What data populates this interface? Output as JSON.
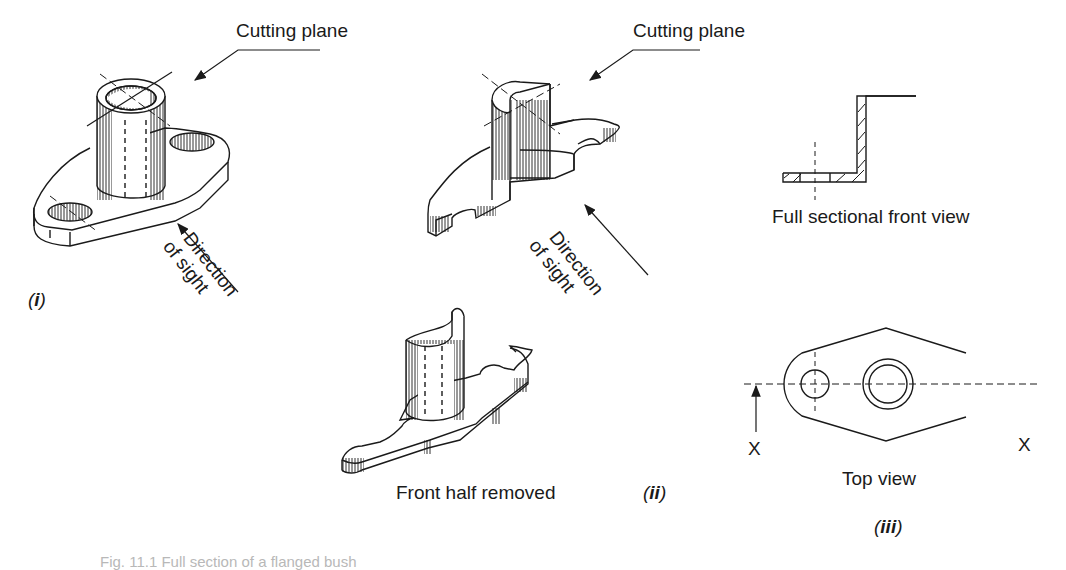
{
  "figure": {
    "panels": [
      {
        "id": "i",
        "label": "(i)",
        "description": "Isometric view of a flanged bush with cutting plane",
        "annotations": {
          "cutting_plane": "Cutting plane",
          "direction_line1": "Direction",
          "direction_line2": "of sight"
        }
      },
      {
        "id": "ii",
        "label": "(ii)",
        "description": "Part cut along cutting plane and front half removed",
        "annotations": {
          "cutting_plane": "Cutting plane",
          "direction_line1": "Direction",
          "direction_line2": "of sight",
          "front_half": "Front half removed"
        }
      },
      {
        "id": "iii",
        "label": "(iii)",
        "annotations": {
          "sectional_view": "Full sectional front view",
          "top_view": "Top view",
          "section_mark_left": "X",
          "section_mark_right": "X"
        }
      }
    ],
    "caption": "Fig. 11.1  Full section of a flanged bush"
  },
  "colors": {
    "line": "#1a1a1a",
    "background": "#ffffff",
    "caption": "#b8b8b8"
  }
}
